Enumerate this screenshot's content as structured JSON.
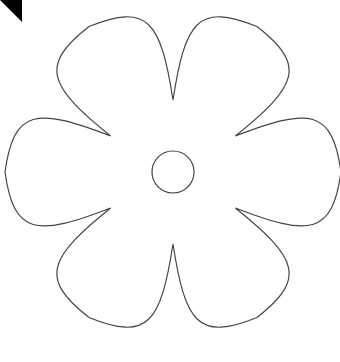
{
  "page": {
    "title": "Flower Outline Template",
    "width": 340,
    "height": 362,
    "background_color": "#ffffff"
  },
  "corner_marker": {
    "name": "black-corner-triangle",
    "description": "Solid black right triangle in the top-left corner",
    "color": "#000000",
    "size": 22,
    "orientation": "diagonal from bottom-left to top-right, filled above"
  },
  "drawing": {
    "name": "six-petal-flower-outline",
    "description": "Thin outline drawing of a six petal flower with a small circle at the center",
    "stroke_color": "#444444",
    "stroke_width": 1.2,
    "fill_color": "none",
    "petal_count": 6,
    "bounds": {
      "left": 8,
      "top": 5,
      "right": 331,
      "bottom": 345
    },
    "center": {
      "x": 173,
      "y": 172
    },
    "notch_tips": [
      {
        "label": "top-notch",
        "x": 172,
        "y": 41
      },
      {
        "label": "left-notch",
        "x": 30,
        "y": 173
      },
      {
        "label": "right-notch",
        "x": 303,
        "y": 173
      },
      {
        "label": "bottom-notch",
        "x": 172,
        "y": 300
      }
    ]
  },
  "center_circle": {
    "name": "flower-center-circle",
    "cx": 173,
    "cy": 172,
    "r": 21,
    "stroke_color": "#444444",
    "stroke_width": 1.2,
    "fill_color": "none"
  },
  "chart_data": {
    "type": "scatter",
    "xlabel": "",
    "ylabel": "",
    "xlim": [
      0,
      340
    ],
    "ylim": [
      0,
      362
    ],
    "grid": false,
    "legend": "none",
    "series": [
      {
        "name": "flower-outline-path",
        "closed": true,
        "x": [
          172,
          232,
          303,
          232,
          172,
          110,
          30,
          110
        ],
        "y": [
          41,
          62,
          173,
          283,
          300,
          283,
          173,
          62
        ]
      },
      {
        "name": "center-circle",
        "closed": true,
        "x": [
          173
        ],
        "y": [
          172
        ],
        "radius": 21
      }
    ]
  }
}
